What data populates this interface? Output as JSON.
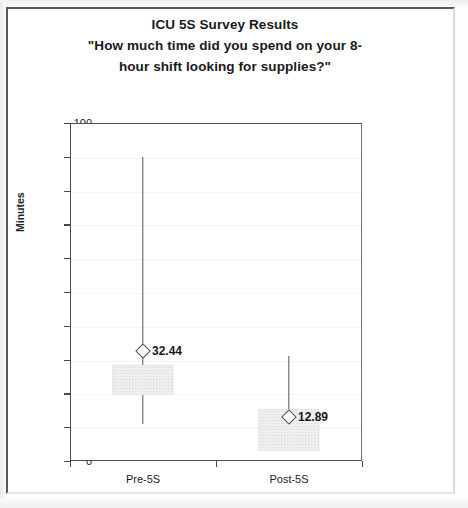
{
  "chart_data": {
    "type": "box",
    "title": "ICU 5S Survey Results",
    "subtitle_line1": "\"How much time did you spend on your 8-",
    "subtitle_line2": "hour shift looking for supplies?\"",
    "xlabel": "",
    "ylabel": "Minutes",
    "ylim": [
      0,
      100
    ],
    "ytick_step": 10,
    "yticks": [
      "0",
      "10",
      "20",
      "30",
      "40",
      "50",
      "60",
      "70",
      "80",
      "90",
      "100"
    ],
    "grid": false,
    "legend": null,
    "categories": [
      "Pre-5S",
      "Post-5S"
    ],
    "series": [
      {
        "name": "Pre-5S",
        "mean": 32.44,
        "mean_label": "32.44",
        "whisker_high": 90,
        "box_top": 28.5,
        "box_bottom": 19.5,
        "whisker_low": 11
      },
      {
        "name": "Post-5S",
        "mean": 12.89,
        "mean_label": "12.89",
        "whisker_high": 31,
        "box_top": 15.5,
        "box_bottom": 3,
        "whisker_low": 3
      }
    ],
    "colors": {
      "axis": "#4b4e52",
      "whisker": "#53565a",
      "box_fill": "#efefef",
      "marker_edge": "#4d5054",
      "text": "#1d1e20"
    }
  }
}
